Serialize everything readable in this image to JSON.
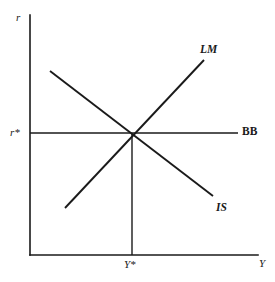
{
  "figure": {
    "width": 275,
    "height": 282,
    "background_color": "#ffffff",
    "line_color": "#1a1a1a"
  },
  "axes": {
    "y_axis_label": "r",
    "x_axis_label": "Y",
    "y_axis": {
      "x": 30,
      "y_top": 15,
      "y_bottom": 255
    },
    "x_axis": {
      "y": 255,
      "x_left": 30,
      "x_right": 258
    }
  },
  "ticks": {
    "y_tick_label": "r*",
    "x_tick_label": "Y*",
    "equilibrium_point": {
      "x": 132,
      "y": 133
    }
  },
  "curves": [
    {
      "name": "LM",
      "label": "LM",
      "slope": "upward",
      "x1": 65,
      "y1": 208,
      "x2": 204,
      "y2": 60
    },
    {
      "name": "IS",
      "label": "IS",
      "slope": "downward",
      "x1": 50,
      "y1": 71,
      "x2": 213,
      "y2": 196
    },
    {
      "name": "BB",
      "label": "BB",
      "slope": "horizontal",
      "x1": 30,
      "y1": 133,
      "x2": 238,
      "y2": 133
    }
  ],
  "guide_line": {
    "name": "equilibrium-output-dropline",
    "x": 132,
    "y_top": 133,
    "y_bottom": 255
  },
  "chart_data": {
    "type": "line",
    "xlabel": "Y",
    "ylabel": "r",
    "grid": false,
    "legend": "inline-curve-labels",
    "xlim": [
      30,
      258
    ],
    "ylim": [
      255,
      15
    ],
    "series": [
      {
        "name": "LM",
        "points": [
          [
            65,
            208
          ],
          [
            204,
            60
          ]
        ],
        "description": "Upward sloping money market equilibrium locus"
      },
      {
        "name": "IS",
        "points": [
          [
            50,
            71
          ],
          [
            213,
            196
          ]
        ],
        "description": "Downward sloping goods market equilibrium locus"
      },
      {
        "name": "BB",
        "points": [
          [
            30,
            133
          ],
          [
            238,
            133
          ]
        ],
        "description": "Horizontal balance of payments locus at world interest rate"
      }
    ],
    "annotations": [
      {
        "text": "r*",
        "x": 13,
        "y": 133,
        "role": "equilibrium interest rate tick"
      },
      {
        "text": "Y*",
        "x": 126,
        "y": 266,
        "role": "equilibrium output tick"
      },
      {
        "text": "LM",
        "x": 203,
        "y": 50,
        "role": "curve label"
      },
      {
        "text": "IS",
        "x": 219,
        "y": 208,
        "role": "curve label"
      },
      {
        "text": "BB",
        "x": 245,
        "y": 133,
        "role": "curve label"
      },
      {
        "text": "r",
        "x": 20,
        "y": 18,
        "role": "y axis label"
      },
      {
        "text": "Y",
        "x": 261,
        "y": 265,
        "role": "x axis label"
      }
    ]
  }
}
